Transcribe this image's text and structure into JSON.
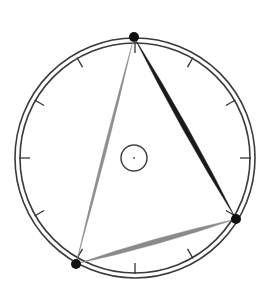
{
  "diagram": {
    "background": "#ffffff",
    "center": {
      "x": 135,
      "y": 158
    },
    "outer_ring": {
      "r_outer": 120,
      "r_inner": 115,
      "stroke": "#3a3a3a",
      "stroke_width": 1.6
    },
    "ticks": {
      "count": 12,
      "length": 10,
      "stroke": "#333333",
      "stroke_width": 1.3
    },
    "center_circle": {
      "r": 13,
      "stroke": "#444444",
      "stroke_width": 1.5,
      "dot_r": 1,
      "dot_color": "#555555"
    },
    "points": [
      {
        "id": "top",
        "x": 134,
        "y": 37,
        "r": 5,
        "color": "#111111"
      },
      {
        "id": "right",
        "x": 236,
        "y": 219,
        "r": 5,
        "color": "#111111"
      },
      {
        "id": "bottom-left",
        "x": 76,
        "y": 264,
        "r": 5,
        "color": "#111111"
      }
    ],
    "connections": [
      {
        "from": "top",
        "to": "right",
        "max_width": 5,
        "color": "#1a1a1a"
      },
      {
        "from": "right",
        "to": "bottom-left",
        "max_width": 5,
        "color": "#8a8a8a"
      },
      {
        "from": "top",
        "to": "bottom-left",
        "max_width": 3,
        "color": "#8f8f8f"
      }
    ]
  }
}
